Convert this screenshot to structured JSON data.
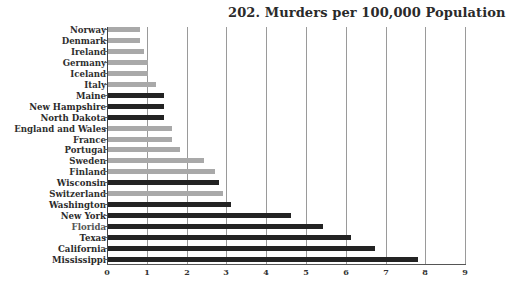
{
  "chart_data": {
    "type": "bar",
    "orientation": "horizontal",
    "title": "202. Murders per 100,000 Population",
    "xlabel": "",
    "ylabel": "",
    "xlim": [
      0,
      9
    ],
    "xticks": [
      "0",
      "1",
      "2",
      "3",
      "4",
      "5",
      "6",
      "7",
      "8",
      "9"
    ],
    "grid": true,
    "legend": null,
    "categories": [
      "Norway",
      "Denmark",
      "Ireland",
      "Germany",
      "Iceland",
      "Italy",
      "Maine",
      "New Hampshire",
      "North Dakota",
      "England and Wales",
      "France",
      "Portugal",
      "Sweden",
      "Finland",
      "Wisconsin",
      "Switzerland",
      "Washington",
      "New York",
      "Florida",
      "Texas",
      "California",
      "Mississippi"
    ],
    "values": [
      0.8,
      0.8,
      0.9,
      1.0,
      1.0,
      1.2,
      1.4,
      1.4,
      1.4,
      1.6,
      1.6,
      1.8,
      2.4,
      2.7,
      2.8,
      2.9,
      3.1,
      4.6,
      5.4,
      6.1,
      6.7,
      7.8
    ],
    "group": [
      "country",
      "country",
      "country",
      "country",
      "country",
      "country",
      "us_state",
      "us_state",
      "us_state",
      "country",
      "country",
      "country",
      "country",
      "country",
      "us_state",
      "country",
      "us_state",
      "us_state",
      "us_state",
      "us_state",
      "us_state",
      "us_state"
    ],
    "colors": {
      "country": "#a9a9a9",
      "us_state": "#232323"
    }
  }
}
